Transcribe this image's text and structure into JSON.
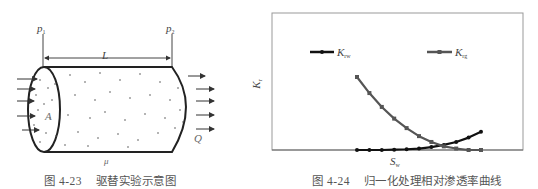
{
  "figure_left": {
    "caption_number": "图 4-23",
    "caption_text": "驱替实验示意图",
    "labels": {
      "p1": "p",
      "p1_sub": "1",
      "p2": "p",
      "p2_sub": "2",
      "length": "L",
      "area": "A",
      "flow": "Q",
      "viscosity": "μ"
    }
  },
  "figure_right": {
    "caption_number": "图 4-24",
    "caption_text": "归一化处理相对渗透率曲线",
    "ylabel": "K",
    "ylabel_sub": "r",
    "xlabel": "S",
    "xlabel_sub": "w",
    "legend": [
      {
        "label": "K",
        "sub": "rw",
        "color": "#111111",
        "marker": "circle"
      },
      {
        "label": "K",
        "sub": "rg",
        "color": "#555555",
        "marker": "square"
      }
    ]
  },
  "chart_data": {
    "type": "line",
    "title": "归一化处理相对渗透率曲线",
    "xlabel": "Sw",
    "ylabel": "Kr",
    "grid": false,
    "legend_position": "top, inside plot",
    "x": [
      0.0,
      0.1,
      0.2,
      0.3,
      0.4,
      0.5,
      0.6,
      0.7,
      0.8,
      0.9,
      1.0
    ],
    "series": [
      {
        "name": "Krw",
        "color": "#111111",
        "marker": "circle",
        "values": [
          0.0,
          0.0,
          0.0,
          0.005,
          0.01,
          0.02,
          0.04,
          0.07,
          0.11,
          0.17,
          0.25
        ]
      },
      {
        "name": "Krg",
        "color": "#555555",
        "marker": "square",
        "values": [
          1.0,
          0.78,
          0.59,
          0.43,
          0.3,
          0.19,
          0.11,
          0.05,
          0.02,
          0.0,
          0.0
        ]
      }
    ],
    "ylim": [
      0,
      1.6
    ],
    "xlim": [
      -0.67,
      1.3
    ],
    "axis_ticks": "none"
  }
}
